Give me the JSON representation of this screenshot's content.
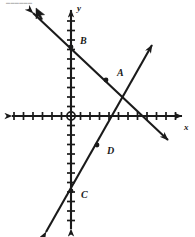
{
  "figure": {
    "background_color": "#ffffff",
    "ink_color": "#1a1a1a",
    "artifact_text": "  ▬▬▬▬▬▬"
  },
  "axes": {
    "x_label": "x",
    "y_label": "y",
    "origin_label": "O",
    "origin_px": {
      "x": 71,
      "y": 116
    },
    "tick_spacing_px": 9.5,
    "x_ticks_left": 8,
    "x_ticks_right": 12,
    "y_ticks_up": 11,
    "y_ticks_down": 11,
    "x_range": [
      -8,
      12
    ],
    "y_range": [
      -11,
      11
    ],
    "grid": false,
    "tick_half_length_px": 4
  },
  "lines": [
    {
      "name": "line-AB",
      "description": "Descending line through B and A",
      "slope": -1,
      "y_intercept": 7,
      "x_intercept": 7,
      "start_px": {
        "x": 33,
        "y": 13
      },
      "end_px": {
        "x": 168,
        "y": 140
      },
      "arrow_start": true,
      "arrow_end": true,
      "stroke_width": 2.1
    },
    {
      "name": "line-CD",
      "description": "Ascending line through C and D",
      "slope": 1.75,
      "y_intercept": -8,
      "x_intercept": 4.5,
      "start_px": {
        "x": 46,
        "y": 232
      },
      "end_px": {
        "x": 152,
        "y": 45
      },
      "arrow_start": true,
      "arrow_end": true,
      "stroke_width": 2.1
    }
  ],
  "points": [
    {
      "id": "A",
      "label": "A",
      "on_line": "line-AB",
      "px": {
        "x": 106,
        "y": 80
      },
      "label_px": {
        "x": 117,
        "y": 76
      },
      "coords": [
        3.7,
        3.8
      ],
      "dot_radius": 2.4
    },
    {
      "id": "B",
      "label": "B",
      "on_line": "line-AB",
      "px": {
        "x": 71,
        "y": 47
      },
      "label_px": {
        "x": 80,
        "y": 44
      },
      "coords": [
        0,
        7.3
      ],
      "dot_radius": 2.4
    },
    {
      "id": "C",
      "label": "C",
      "on_line": "line-CD",
      "px": {
        "x": 71,
        "y": 191
      },
      "label_px": {
        "x": 81,
        "y": 198
      },
      "coords": [
        0,
        -7.9
      ],
      "dot_radius": 2.4
    },
    {
      "id": "D",
      "label": "D",
      "on_line": "line-CD",
      "px": {
        "x": 97,
        "y": 145
      },
      "label_px": {
        "x": 107,
        "y": 154
      },
      "coords": [
        2.7,
        -3.1
      ],
      "dot_radius": 2.4
    }
  ],
  "intersection": {
    "px": {
      "x": 123,
      "y": 98
    },
    "marked": false
  },
  "cursor": {
    "visible": true,
    "px": {
      "x": 36,
      "y": 8
    },
    "kind": "arrow-pointer"
  }
}
